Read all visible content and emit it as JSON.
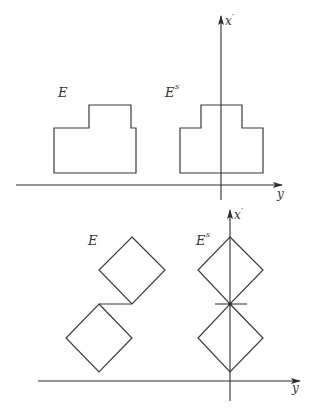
{
  "header": {
    "partial_text": "..."
  },
  "diagram_top": {
    "label_E": "E",
    "label_Es_base": "E",
    "label_Es_sup": "s",
    "axis_vertical_label": "x",
    "axis_vertical_prime": "′",
    "axis_horizontal_label": "y",
    "description": "Steiner symmetrization of a stepped polygon E into symmetric set E^s about the x' axis"
  },
  "diagram_bottom": {
    "label_E": "E",
    "label_Es_base": "E",
    "label_Es_sup": "s",
    "axis_vertical_label": "x",
    "axis_vertical_prime": "′",
    "axis_horizontal_label": "y",
    "description": "Two offset squares (diamonds) E symmetrized into two stacked diamonds E^s on the x' axis"
  },
  "colors": {
    "stroke": "#3a3a3a",
    "axis": "#2e2e2e",
    "background": "#ffffff"
  }
}
